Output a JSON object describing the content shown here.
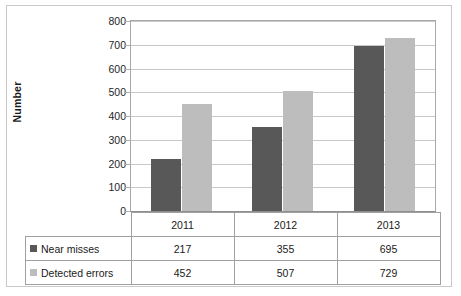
{
  "chart_data": {
    "type": "bar",
    "title": "",
    "xlabel": "",
    "ylabel": "Number",
    "categories": [
      "2011",
      "2012",
      "2013"
    ],
    "series": [
      {
        "name": "Near misses",
        "values": [
          217,
          355,
          695
        ],
        "color": "#585858"
      },
      {
        "name": "Detected errors",
        "values": [
          452,
          507,
          729
        ],
        "color": "#bdbdbd"
      }
    ],
    "ylim": [
      0,
      800
    ],
    "ytick_labels": [
      "800",
      "700",
      "600",
      "500",
      "400",
      "300",
      "200",
      "100",
      "0"
    ],
    "ytick_values": [
      800,
      700,
      600,
      500,
      400,
      300,
      200,
      100,
      0
    ],
    "grid": true,
    "legend_position": "data-table-left-column",
    "data_table": {
      "header_row": [
        "",
        "2011",
        "2012",
        "2013"
      ],
      "rows": [
        {
          "label": "Near misses",
          "swatch": "series-0-swatch",
          "cells": [
            "217",
            "355",
            "695"
          ]
        },
        {
          "label": "Detected errors",
          "swatch": "series-1-swatch",
          "cells": [
            "452",
            "507",
            "729"
          ]
        }
      ]
    }
  }
}
